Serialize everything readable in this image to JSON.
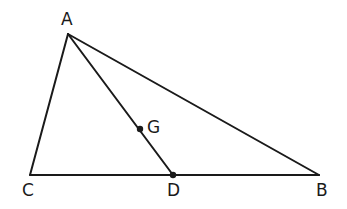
{
  "diagram": {
    "type": "triangle-with-median",
    "points": {
      "A": {
        "label": "A",
        "x": 68,
        "y": 34
      },
      "B": {
        "label": "B",
        "x": 319,
        "y": 175
      },
      "C": {
        "label": "C",
        "x": 30,
        "y": 175
      },
      "D": {
        "label": "D",
        "x": 173,
        "y": 175
      },
      "G": {
        "label": "G",
        "x": 140,
        "y": 129
      }
    },
    "segments": [
      [
        "A",
        "B"
      ],
      [
        "A",
        "C"
      ],
      [
        "C",
        "B"
      ],
      [
        "A",
        "D"
      ]
    ],
    "marked_points": [
      "G",
      "D"
    ],
    "stroke_color": "#1a1a1a"
  }
}
